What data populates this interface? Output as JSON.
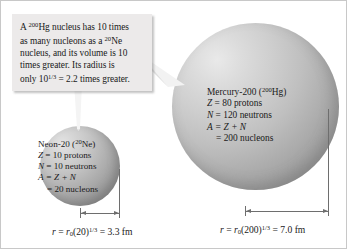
{
  "callout": {
    "line1_a": "A ",
    "line1_iso": "200",
    "line1_b": "Hg nucleus has 10 times",
    "line2_a": "as many nucleons as a ",
    "line2_iso": "20",
    "line2_b": "Ne",
    "line3": "nucleus, and its volume is 10",
    "line4": "times greater. Its radius is",
    "line5_a": "only 10",
    "line5_exp": "1/3",
    "line5_b": " = 2.2 times greater."
  },
  "neon": {
    "name_a": "Neon-20 (",
    "name_iso": "20",
    "name_b": "Ne)",
    "protons_sym": "Z",
    "protons": " = 10 protons",
    "neutrons_sym": "N",
    "neutrons": " = 10 neutrons",
    "mass_sym": "A",
    "mass": " = Z + N",
    "nucleons": "= 20 nucleons",
    "radius_r": "r",
    "radius_eq": " = ",
    "radius_r0": "r",
    "radius_r0_sub": "0",
    "radius_paren": "(20)",
    "radius_exp": "1/3",
    "radius_result": " = 3.3 fm"
  },
  "mercury": {
    "name_a": "Mercury-200 (",
    "name_iso": "200",
    "name_b": "Hg)",
    "protons_sym": "Z",
    "protons": " = 80 protons",
    "neutrons_sym": "N",
    "neutrons": " = 120 neutrons",
    "mass_sym": "A",
    "mass": " = Z + N",
    "nucleons": "= 200 nucleons",
    "radius_r": "r",
    "radius_eq": " = ",
    "radius_r0": "r",
    "radius_r0_sub": "0",
    "radius_paren": "(200)",
    "radius_exp": "1/3",
    "radius_result": " = 7.0 fm"
  },
  "colors": {
    "callout_bg": "#eceaea",
    "sphere_light": "#e9e9e9",
    "sphere_dark": "#8a8a8a",
    "dimension_line": "#6e6e6e",
    "text": "#1a1a1a"
  }
}
